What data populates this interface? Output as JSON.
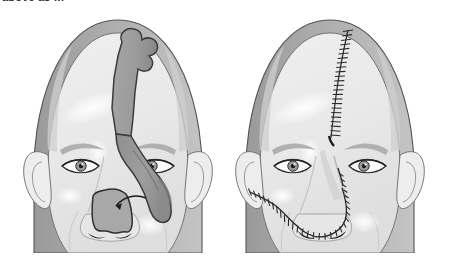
{
  "figure": {
    "title_fragment": "above as in",
    "domain": "medical-illustration",
    "background_color": "#ffffff",
    "palette": {
      "outline": "#4a4a4a",
      "outline_dark": "#333333",
      "skin_light": "#f2f2f2",
      "skin_mid": "#e2e2e2",
      "skin_shadow": "#c9c9c9",
      "scalp_rim": "#b5b5b5",
      "scalp_rim_dark": "#9a9a9a",
      "flap_fill": "#9d9d9d",
      "flap_fill_dark": "#8a8a8a",
      "defect_fill": "#a8a8a8",
      "brow_gray": "#b0b0b0",
      "nostril_dark": "#1a1a1a",
      "suture_color": "#2a2a2a",
      "highlight_white": "#ffffff"
    },
    "panels": [
      {
        "id": "panel-left",
        "label": "Flap design and defect",
        "center_x": 118,
        "elements": [
          {
            "name": "scalp",
            "type": "dome"
          },
          {
            "name": "forehead-flap-outline",
            "type": "flap",
            "note": "paddle with lobed distal tip, long pedicle"
          },
          {
            "name": "flap-pedicle",
            "type": "pedicle",
            "note": "descends lateral to nasal dorsum over medial canthus"
          },
          {
            "name": "nasal-tip-defect",
            "type": "defect",
            "note": "shield shaped with scalloped inferior margin"
          },
          {
            "name": "transfer-arrow",
            "type": "arrow",
            "note": "curved arrow from flap tip to defect"
          },
          {
            "name": "left-eye",
            "type": "eye"
          },
          {
            "name": "right-eye",
            "type": "eye"
          },
          {
            "name": "left-ear",
            "type": "ear"
          },
          {
            "name": "right-ear",
            "type": "ear"
          },
          {
            "name": "nostrils",
            "type": "nostrils"
          }
        ]
      },
      {
        "id": "panel-right",
        "label": "Post-operative closure",
        "center_x": 330,
        "elements": [
          {
            "name": "scalp",
            "type": "dome"
          },
          {
            "name": "forehead-donor-suture-line",
            "type": "suture",
            "note": "vertical ladder suture from hairline to glabella",
            "stitch_count": 24
          },
          {
            "name": "nasal-graft-suture-line",
            "type": "suture",
            "note": "U shaped suture around reconstructed nasal tip",
            "stitch_count": 30
          },
          {
            "name": "left-eye",
            "type": "eye"
          },
          {
            "name": "right-eye",
            "type": "eye"
          },
          {
            "name": "left-ear",
            "type": "ear"
          },
          {
            "name": "right-ear",
            "type": "ear"
          },
          {
            "name": "nostrils",
            "type": "nostrils"
          }
        ]
      }
    ]
  }
}
